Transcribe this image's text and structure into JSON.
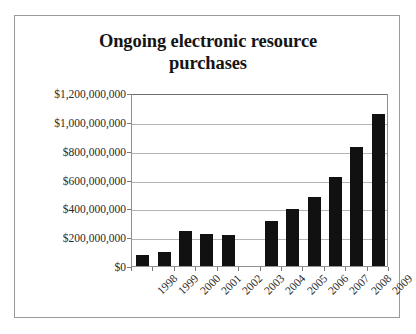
{
  "chart_data": {
    "type": "bar",
    "title": "Ongoing electronic resource purchases",
    "title_line1": "Ongoing electronic resource",
    "title_line2": "purchases",
    "xlabel": "",
    "ylabel": "",
    "categories": [
      "1998",
      "1999",
      "2000",
      "2001",
      "2002",
      "2003",
      "2004",
      "2005",
      "2006",
      "2007",
      "2008",
      "2009"
    ],
    "values": [
      75000000,
      100000000,
      245000000,
      222000000,
      218000000,
      null,
      315000000,
      395000000,
      480000000,
      620000000,
      825000000,
      1055000000
    ],
    "series": [
      {
        "name": "Ongoing electronic resource purchases",
        "values": [
          75000000,
          100000000,
          245000000,
          222000000,
          218000000,
          null,
          315000000,
          395000000,
          480000000,
          620000000,
          825000000,
          1055000000
        ]
      }
    ],
    "ylim": [
      0,
      1200000000
    ],
    "ytick_values": [
      0,
      200000000,
      400000000,
      600000000,
      800000000,
      1000000000,
      1200000000
    ],
    "ytick_labels": [
      "$0",
      "$200,000,000",
      "$400,000,000",
      "$600,000,000",
      "$800,000,000",
      "$1,000,000,000",
      "$1,200,000,000"
    ],
    "xtick_labels": [
      "1998",
      "1999",
      "2000",
      "2001",
      "2002",
      "2003",
      "2004",
      "2005",
      "2006",
      "2007",
      "2008",
      "2009"
    ],
    "grid": true,
    "grid_axis": "y",
    "legend": false,
    "legend_position": "none",
    "bar_color": "#111111",
    "grid_color": "#b4b4b4",
    "axis_color": "#8f8f8f",
    "background_color": "#ffffff",
    "note": "2003 has no bar (missing data)"
  }
}
